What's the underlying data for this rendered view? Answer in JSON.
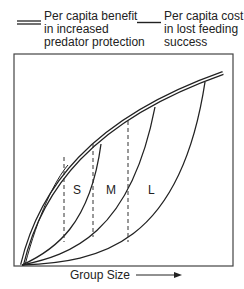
{
  "legend": {
    "benefit": {
      "label": "Per capita benefit\nin increased\npredator protection",
      "line_style": "double"
    },
    "cost": {
      "label": "Per capita cost\nin lost feeding\nsuccess",
      "line_style": "single"
    }
  },
  "axis": {
    "x_label": "Group Size",
    "x_arrow": "right-arrow"
  },
  "regions": {
    "small": "S",
    "medium": "M",
    "large": "L"
  },
  "colors": {
    "line": "#222222",
    "frame": "#444444",
    "background": "#ffffff"
  }
}
